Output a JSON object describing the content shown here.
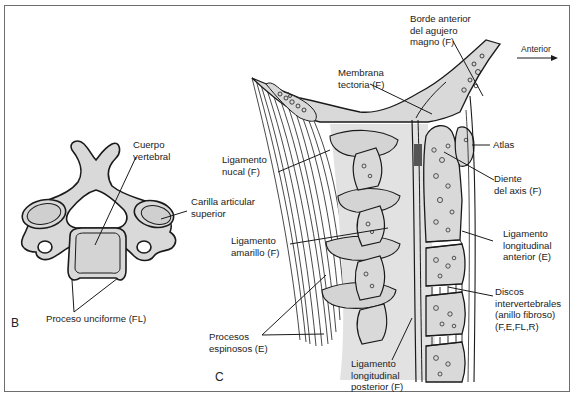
{
  "figure": {
    "panels": [
      {
        "id": "B",
        "label": "B",
        "view": "superior view of cervical vertebra"
      },
      {
        "id": "C",
        "label": "C",
        "view": "sagittal section of upper cervical spine"
      }
    ],
    "orientation": {
      "label": "Anterior",
      "arrow": "right"
    }
  },
  "labels": {
    "cuerpo_vertebral": "Cuerpo\nvertebral",
    "carilla_articular": "Carilla articular\nsuperior",
    "proceso_unciforme": "Proceso unciforme (FL)",
    "borde_anterior": "Borde anterior\ndel agujero\nmagno (F)",
    "membrana_tectoria": "Membrana\ntectoria (F)",
    "ligamento_nucal": "Ligamento\nnucal (F)",
    "atlas": "Atlas",
    "diente_axis": "Diente\ndel axis (F)",
    "ligamento_amarillo": "Ligamento\namarillo (F)",
    "ligamento_long_anterior": "Ligamento\nlongitudinal\nanterior (E)",
    "discos": "Discos\nintervertebrales\n(anillo fibroso)\n(F,E,FL,R)",
    "procesos_espinosos": "Procesos\nespinosos (E)",
    "ligamento_long_posterior": "Ligamento\nlongitudinal\nposterior (F)"
  },
  "colors": {
    "bone_fill": "#d9d9d9",
    "line": "#1a1a1a",
    "frame": "#6e6e6e"
  }
}
